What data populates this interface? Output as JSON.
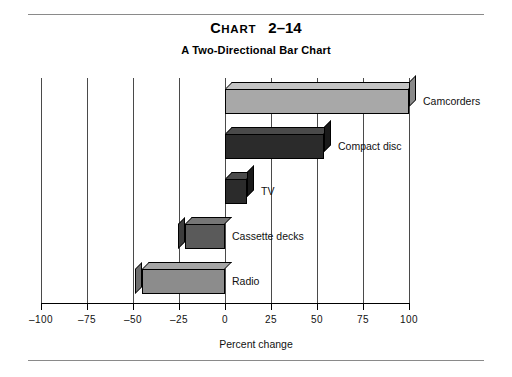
{
  "title": {
    "lead": "C",
    "rest": "HART",
    "number": "2–14"
  },
  "subtitle": "A Two-Directional Bar Chart",
  "axis_title": "Percent change",
  "chart_data": {
    "type": "bar",
    "orientation": "horizontal",
    "subtitle": "A Two-Directional Bar Chart",
    "xlabel": "Percent change",
    "ylabel": "",
    "xlim": [
      -100,
      100
    ],
    "grid": true,
    "legend": false,
    "categories": [
      "Camcorders",
      "Compact disc",
      "TV",
      "Cassette decks",
      "Radio"
    ],
    "values": [
      100,
      54,
      12,
      -22,
      -45
    ],
    "tick_values": [
      -100,
      -75,
      -50,
      -25,
      0,
      25,
      50,
      75,
      100
    ],
    "tick_labels": [
      "–100",
      "–75",
      "–50",
      "–25",
      "0",
      "25",
      "50",
      "75",
      "100"
    ],
    "bar_colors": [
      "#a8a8a8",
      "#2b2b2b",
      "#2b2b2b",
      "#5a5a5a",
      "#8c8c8c"
    ],
    "bars": [
      {
        "label": "Camcorders",
        "value": 100,
        "color": "#a8a8a8",
        "top_color": "#c4c4c4",
        "side_color": "#8a8a8a"
      },
      {
        "label": "Compact disc",
        "value": 54,
        "color": "#2b2b2b",
        "top_color": "#4a4a4a",
        "side_color": "#1a1a1a"
      },
      {
        "label": "TV",
        "value": 12,
        "color": "#2b2b2b",
        "top_color": "#4a4a4a",
        "side_color": "#1a1a1a"
      },
      {
        "label": "Cassette decks",
        "value": -22,
        "color": "#5a5a5a",
        "top_color": "#767676",
        "side_color": "#3c3c3c"
      },
      {
        "label": "Radio",
        "value": -45,
        "color": "#8c8c8c",
        "top_color": "#a6a6a6",
        "side_color": "#6e6e6e"
      }
    ]
  }
}
